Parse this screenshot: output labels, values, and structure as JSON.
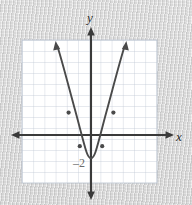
{
  "figure": {
    "kind": "coordinate-plane-graph",
    "axis_labels": {
      "x": "x",
      "y": "y"
    },
    "value_labels": [
      {
        "text": "–2",
        "meaning": "y-intercept and vertex y-value",
        "x_px": 80,
        "y_px": 163
      }
    ],
    "colors": {
      "background": "#d6d6d6",
      "grid_fill": "#ffffff",
      "grid_line": "#b9c2cf",
      "axis": "#3a3a3a",
      "curve": "#4a4a4a",
      "label_text": "#2e2e2e",
      "value_label_text": "#6b6b6b"
    },
    "grid": {
      "left_px": 22,
      "top_px": 40,
      "right_px": 157,
      "bottom_px": 183,
      "columns": 12,
      "rows": 13,
      "cell_px": 11.2
    },
    "axes": {
      "origin_px": {
        "x": 91,
        "y": 135
      },
      "unit_px": 11.2,
      "x_axis": {
        "start_px": 12,
        "end_px": 173,
        "y_px": 135,
        "arrows": "both"
      },
      "y_axis": {
        "start_px": 28,
        "end_px": 198,
        "x_px": 91,
        "arrows": "both"
      }
    }
  },
  "chart_data": {
    "type": "line",
    "title": "",
    "xlabel": "x",
    "ylabel": "y",
    "grid": true,
    "legend": "none",
    "xlim": [
      -6.2,
      5.9
    ],
    "ylim": [
      -4.3,
      8.5
    ],
    "series": [
      {
        "name": "parabola",
        "equation": "y = x² – 2",
        "vertex": [
          0,
          -2
        ],
        "opens": "up",
        "endpoints_arrowed": true,
        "x": [
          -3.2,
          -2.5,
          -2,
          -1.5,
          -1,
          -0.5,
          0,
          0.5,
          1,
          1.5,
          2,
          2.5,
          3.2
        ],
        "y": [
          8.24,
          4.25,
          2,
          0.25,
          -1,
          -1.75,
          -2,
          -1.75,
          -1,
          0.25,
          2,
          4.25,
          8.24
        ],
        "marked_points": [
          {
            "x": -2,
            "y": 2
          },
          {
            "x": -1,
            "y": -1
          },
          {
            "x": 1,
            "y": -1
          },
          {
            "x": 2,
            "y": 2
          }
        ]
      }
    ],
    "annotations": [
      {
        "text": "–2",
        "x": -0.5,
        "y": -2.5,
        "role": "vertex-y-value"
      }
    ]
  }
}
